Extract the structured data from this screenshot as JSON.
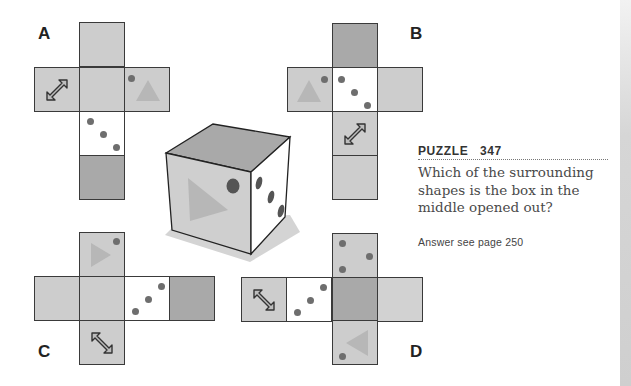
{
  "puzzle": {
    "title": "PUZZLE   347",
    "question": "Which of the surrounding shapes is the box in the middle opened out?",
    "answer_ref": "Answer see page 250"
  },
  "options": [
    {
      "label": "A",
      "faces": [
        "grey-top",
        "arrow",
        "grey-center",
        "triangle-dot",
        "three-dots",
        "dark"
      ]
    },
    {
      "label": "B",
      "faces": [
        "dark-top",
        "triangle-dot",
        "three-dots",
        "grey-right",
        "arrow",
        "grey-bottom"
      ]
    },
    {
      "label": "C",
      "faces": [
        "triangle-right-dot",
        "grey-left",
        "grey-center",
        "three-dots",
        "dark",
        "arrow"
      ]
    },
    {
      "label": "D",
      "faces": [
        "three-dots-top",
        "arrow",
        "three-dots",
        "dark",
        "grey-right",
        "triangle-left-dot"
      ]
    }
  ],
  "cube": {
    "top_face": "dark",
    "front_face": "triangle-with-dot",
    "right_face": "three-dots"
  },
  "colors": {
    "grey_face": "#cdcdcd",
    "dark_face": "#a9a9a9",
    "white_face": "#ffffff",
    "dot": "#6e6e6e",
    "triangle": "#b7b7b7"
  }
}
